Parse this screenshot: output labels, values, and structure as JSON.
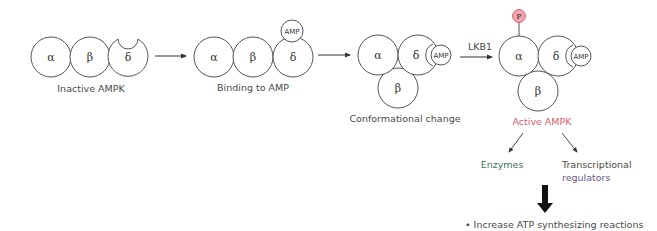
{
  "diagram": {
    "subunits": {
      "alpha": "α",
      "beta": "β",
      "delta": "δ"
    },
    "amp_label": "AMP",
    "phospho_label": "P",
    "stages": [
      {
        "label": "Inactive AMPK"
      },
      {
        "label": "Binding to AMP"
      },
      {
        "label": "Conformational change"
      },
      {
        "label": "Active AMPK"
      }
    ],
    "activation_arrow_label": "LKB1",
    "targets": [
      {
        "label": "Enzymes"
      },
      {
        "label_line1": "Transcriptional",
        "label_line2": "regulators"
      }
    ],
    "outcome": "• Increase ATP synthesizing reactions",
    "colors": {
      "active_label": "#d9606e",
      "phospho_fill": "#f3a6ad",
      "phospho_stroke": "#c0505c",
      "stroke": "#555555",
      "text": "#4a4a4a"
    }
  }
}
